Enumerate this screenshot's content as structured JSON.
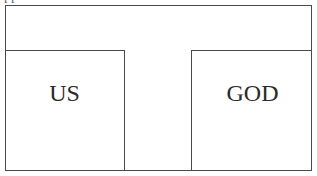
{
  "diagram": {
    "caption_fragment": "pp",
    "top_band": {
      "label": ""
    },
    "boxes": [
      {
        "id": "left",
        "label": "US"
      },
      {
        "id": "right",
        "label": "GOD"
      }
    ],
    "colors": {
      "line": "#4a4a4a",
      "text": "#2a2a2a",
      "background": "#ffffff"
    }
  }
}
